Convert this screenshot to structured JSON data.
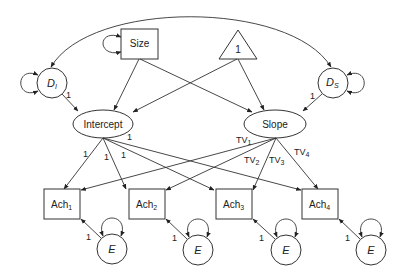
{
  "diagram": {
    "type": "latent growth model path diagram",
    "nodes": {
      "size": {
        "label": "Size",
        "shape": "rectangle"
      },
      "constant": {
        "label": "1",
        "shape": "triangle"
      },
      "d_i": {
        "label": "D",
        "sub": "I",
        "shape": "circle"
      },
      "d_s": {
        "label": "D",
        "sub": "S",
        "shape": "circle"
      },
      "intercept": {
        "label": "Intercept",
        "shape": "ellipse"
      },
      "slope": {
        "label": "Slope",
        "shape": "ellipse"
      },
      "ach": [
        {
          "label": "Ach",
          "sub": "1"
        },
        {
          "label": "Ach",
          "sub": "2"
        },
        {
          "label": "Ach",
          "sub": "3"
        },
        {
          "label": "Ach",
          "sub": "4"
        }
      ],
      "errors": [
        {
          "label": "E"
        },
        {
          "label": "E"
        },
        {
          "label": "E"
        },
        {
          "label": "E"
        }
      ]
    },
    "weights": {
      "di_to_intercept": "1",
      "ds_to_slope": "1",
      "intercept_loadings": [
        "1",
        "1",
        "1",
        "1"
      ],
      "slope_loadings": [
        {
          "label": "TV",
          "sub": "1"
        },
        {
          "label": "TV",
          "sub": "2"
        },
        {
          "label": "TV",
          "sub": "3"
        },
        {
          "label": "TV",
          "sub": "4"
        }
      ],
      "error_loadings": [
        "1",
        "1",
        "1",
        "1"
      ]
    }
  }
}
